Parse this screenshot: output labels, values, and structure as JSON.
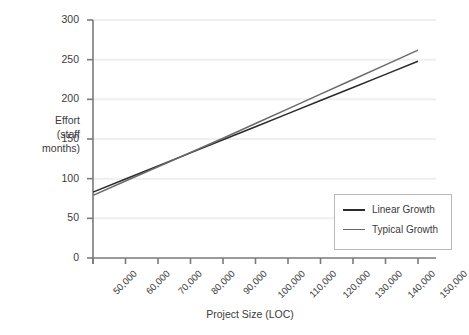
{
  "chart_data": {
    "type": "line",
    "title": "",
    "xlabel": "Project Size (LOC)",
    "ylabel": "Effort\n(staff\nmonths)",
    "ylabel_lines": [
      "Effort",
      "(staff",
      "months)"
    ],
    "x": [
      50000,
      60000,
      70000,
      80000,
      90000,
      100000,
      110000,
      120000,
      130000,
      140000,
      150000
    ],
    "xtick_labels": [
      "50,000",
      "60,000",
      "70,000",
      "80,000",
      "90,000",
      "100,000",
      "110,000",
      "120,000",
      "130,000",
      "140,000",
      "150,000"
    ],
    "ytick_labels": [
      "0",
      "50",
      "100",
      "150",
      "200",
      "250",
      "300"
    ],
    "yticks": [
      0,
      50,
      100,
      150,
      200,
      250,
      300
    ],
    "xlim": [
      50000,
      150000
    ],
    "ylim": [
      0,
      300
    ],
    "grid": "horizontal",
    "legend_position": "lower-right",
    "series": [
      {
        "name": "Linear Growth",
        "color": "#2a2a2a",
        "values": [
          83,
          99.5,
          116,
          132.5,
          149,
          165.5,
          182,
          198.5,
          215,
          231.5,
          248
        ]
      },
      {
        "name": "Typical Growth",
        "color": "#6a6a6a",
        "values": [
          79,
          97,
          115,
          133,
          151,
          169.5,
          188,
          206.5,
          225,
          243.5,
          262
        ]
      }
    ]
  },
  "legend": {
    "items": [
      {
        "label": "Linear Growth",
        "color": "#2a2a2a"
      },
      {
        "label": "Typical Growth",
        "color": "#6a6a6a"
      }
    ]
  },
  "colors": {
    "background": "#ffffff",
    "axis": "#7a7a7a",
    "grid": "#efeff1",
    "text": "#3b3b3b",
    "legend_border": "#b9b9b9"
  }
}
